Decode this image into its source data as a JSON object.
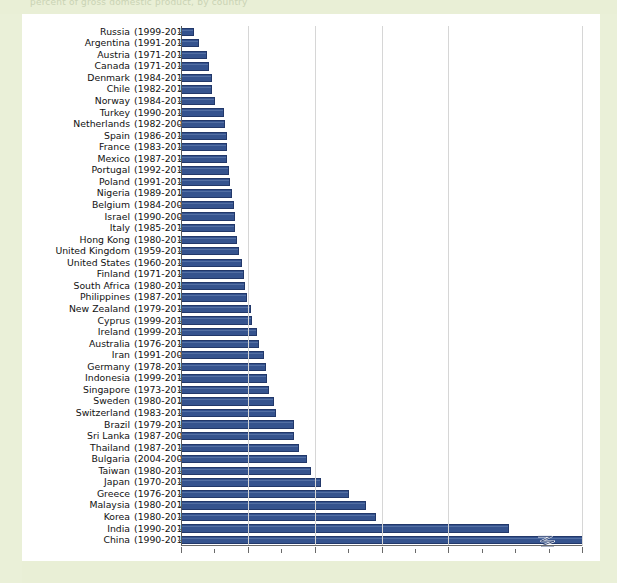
{
  "page": {
    "background_color": "#eaf0d8",
    "card_color": "#ffffff",
    "top_partial_text": "percent of gross domestic product, by country"
  },
  "chart_data": {
    "type": "bar",
    "orientation": "horizontal",
    "title": "",
    "xlabel": "",
    "ylabel": "",
    "xlim": [
      0,
      120
    ],
    "xticks": [
      0,
      20,
      40,
      60,
      80,
      120
    ],
    "xtick_labels": [
      "0%",
      "20%",
      "40%",
      "60%",
      "80%",
      "120%"
    ],
    "axis_break": {
      "present": true,
      "between": [
        80,
        120
      ],
      "marker": "zigzag",
      "applies_to": "China"
    },
    "grid": true,
    "legend": "none",
    "bar_color": "#35538e",
    "bar_edge_color": "#22386a",
    "categories": [
      "Russia",
      "Argentina",
      "Austria",
      "Canada",
      "Denmark",
      "Chile",
      "Norway",
      "Turkey",
      "Netherlands",
      "Spain",
      "France",
      "Mexico",
      "Portugal",
      "Poland",
      "Nigeria",
      "Belgium",
      "Israel",
      "Italy",
      "Hong Kong",
      "United Kingdom",
      "United States",
      "Finland",
      "South Africa",
      "Philippines",
      "New Zealand",
      "Cyprus",
      "Ireland",
      "Australia",
      "Iran",
      "Germany",
      "Indonesia",
      "Singapore",
      "Sweden",
      "Switzerland",
      "Brazil",
      "Sri Lanka",
      "Thailand",
      "Bulgaria",
      "Taiwan",
      "Japan",
      "Greece",
      "Malaysia",
      "Korea",
      "India",
      "China"
    ],
    "year_ranges": [
      "(1999-2013)",
      "(1991-2013)",
      "(1971-2013)",
      "(1971-2013)",
      "(1984-2011)",
      "(1982-2013)",
      "(1984-2013)",
      "(1990-2013)",
      "(1982-2006)",
      "(1986-2013)",
      "(1983-2010)",
      "(1987-2012)",
      "(1992-2013)",
      "(1991-2014)",
      "(1989-2013)",
      "(1984-2006)",
      "(1990-2006)",
      "(1985-2013)",
      "(1980-2013)",
      "(1959-2012)",
      "(1960-2015)",
      "(1971-2013)",
      "(1980-2013)",
      "(1987-2013)",
      "(1979-2013)",
      "(1999-2012)",
      "(1999-2013)",
      "(1976-2011)",
      "(1991-2004)",
      "(1978-2011)",
      "(1999-2014)",
      "(1973-2013)",
      "(1980-2011)",
      "(1983-2013)",
      "(1979-2011)",
      "(1987-2008)",
      "(1987-2012)",
      "(2004-2007)",
      "(1980-2013)",
      "(1970-2013)",
      "(1976-2013)",
      "(1980-2013)",
      "(1980-2014)",
      "(1990-2011)",
      "(1990-2013)"
    ],
    "values": [
      3.5,
      5.0,
      7.5,
      8.0,
      9.0,
      9.0,
      10.0,
      12.5,
      13.0,
      13.5,
      13.5,
      13.5,
      14.0,
      14.5,
      15.0,
      15.5,
      16.0,
      16.0,
      16.5,
      17.0,
      18.0,
      18.5,
      19.0,
      19.5,
      20.5,
      21.0,
      22.5,
      23.0,
      24.5,
      25.0,
      25.5,
      26.0,
      27.5,
      28.0,
      33.5,
      33.5,
      35.0,
      37.5,
      38.5,
      41.5,
      50.0,
      55.0,
      58.0,
      98.0,
      120.0
    ],
    "value_note": "China bar is truncated at the 120% axis break; its true value exceeds the axis maximum."
  }
}
